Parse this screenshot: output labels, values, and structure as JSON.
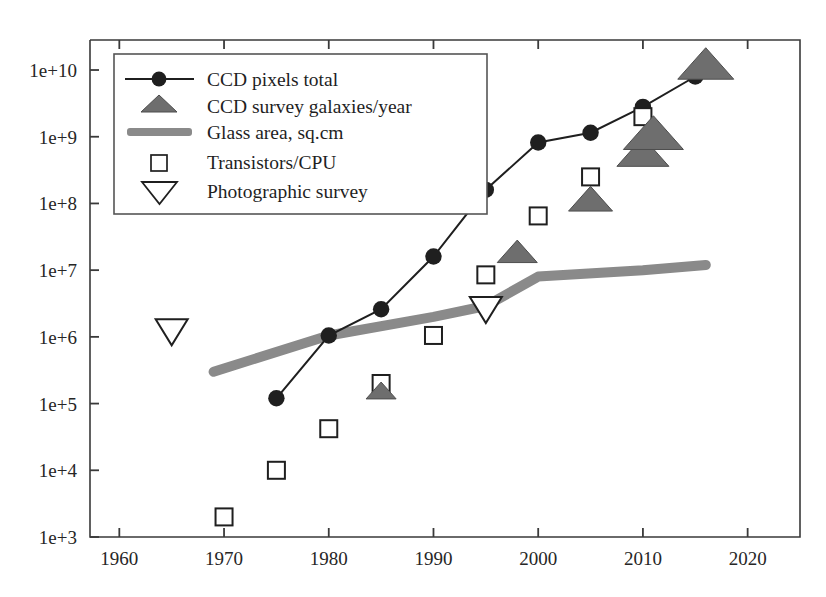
{
  "chart_data": {
    "type": "scatter",
    "title": "",
    "subtitle": "",
    "xlabel": "",
    "ylabel": "",
    "xlim": [
      1957.2,
      2025.0
    ],
    "ylim_log10": [
      3,
      10.45
    ],
    "yscale": "log",
    "grid": false,
    "legend_position": "top-left",
    "xticks": [
      1960,
      1970,
      1980,
      1990,
      2000,
      2010,
      2020
    ],
    "xtick_labels": [
      "1960",
      "1970",
      "1980",
      "1990",
      "2000",
      "2010",
      "2020"
    ],
    "yticks": [
      1000,
      10000,
      100000,
      1000000,
      10000000,
      100000000,
      1000000000,
      10000000000
    ],
    "ytick_labels": [
      "1e+3",
      "1e+4",
      "1e+5",
      "1e+6",
      "1e+7",
      "1e+8",
      "1e+9",
      "1e+10"
    ],
    "series": [
      {
        "name": "CCD pixels total",
        "marker": "filled-circle",
        "line": true,
        "color": "#1f1f1f",
        "points": [
          {
            "x": 1975,
            "y": 120000.0
          },
          {
            "x": 1980,
            "y": 1050000.0
          },
          {
            "x": 1985,
            "y": 2600000.0
          },
          {
            "x": 1990,
            "y": 16000000.0
          },
          {
            "x": 1995,
            "y": 160000000.0
          },
          {
            "x": 2000,
            "y": 820000000.0
          },
          {
            "x": 2005,
            "y": 1150000000.0
          },
          {
            "x": 2010,
            "y": 2800000000.0
          },
          {
            "x": 2015,
            "y": 8000000000.0
          }
        ]
      },
      {
        "name": "CCD survey galaxies/year",
        "marker": "filled-triangle-up",
        "line": false,
        "color": "#6e6e6e",
        "points": [
          {
            "x": 1985,
            "y": 150000.0
          },
          {
            "x": 1998,
            "y": 18000000.0
          },
          {
            "x": 2005,
            "y": 110000000.0
          },
          {
            "x": 2010,
            "y": 550000000.0
          },
          {
            "x": 2011,
            "y": 1050000000.0
          },
          {
            "x": 2016,
            "y": 11500000000.0
          }
        ]
      },
      {
        "name": "Glass area, sq.cm",
        "marker": "thick-line",
        "line": true,
        "color": "#8a8a8a",
        "points": [
          {
            "x": 1969,
            "y": 300000.0
          },
          {
            "x": 1980,
            "y": 1050000.0
          },
          {
            "x": 1990,
            "y": 2000000.0
          },
          {
            "x": 1995,
            "y": 2900000.0
          },
          {
            "x": 2000,
            "y": 8000000.0
          },
          {
            "x": 2010,
            "y": 10000000.0
          },
          {
            "x": 2016,
            "y": 12000000.0
          }
        ]
      },
      {
        "name": "Transistors/CPU",
        "marker": "open-square",
        "line": false,
        "color": "#1f1f1f",
        "points": [
          {
            "x": 1970,
            "y": 2000.0
          },
          {
            "x": 1975,
            "y": 10000.0
          },
          {
            "x": 1980,
            "y": 42000.0
          },
          {
            "x": 1985,
            "y": 200000.0
          },
          {
            "x": 1990,
            "y": 1050000.0
          },
          {
            "x": 1995,
            "y": 8500000.0
          },
          {
            "x": 2000,
            "y": 65000000.0
          },
          {
            "x": 2005,
            "y": 250000000.0
          },
          {
            "x": 2010,
            "y": 2000000000.0
          }
        ]
      },
      {
        "name": "Photographic survey",
        "marker": "open-triangle-down",
        "line": false,
        "color": "#1f1f1f",
        "points": [
          {
            "x": 1965,
            "y": 1300000.0
          },
          {
            "x": 1995,
            "y": 2800000.0
          }
        ]
      }
    ]
  },
  "legend": {
    "items": [
      {
        "label": "CCD pixels total",
        "marker": "line-with-filled-circle"
      },
      {
        "label": "CCD survey galaxies/year",
        "marker": "filled-triangle-up"
      },
      {
        "label": "Glass area, sq.cm",
        "marker": "thick-gray-bar"
      },
      {
        "label": "Transistors/CPU",
        "marker": "open-square"
      },
      {
        "label": "Photographic survey",
        "marker": "open-triangle-down"
      }
    ]
  },
  "colors": {
    "axis": "#3a3a3a",
    "ink": "#1f1f1f",
    "triangle_fill": "#6e6e6e",
    "glass_line": "#8a8a8a",
    "legend_border": "#555555",
    "background": "#ffffff"
  }
}
